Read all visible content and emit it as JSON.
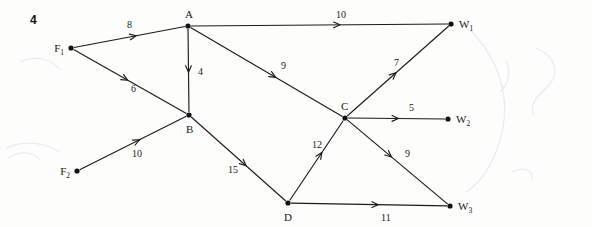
{
  "figure": {
    "number": "4",
    "caption": ""
  },
  "chart_data": {
    "type": "diagram",
    "title": "",
    "subtitle": "",
    "xlabel": "",
    "ylabel": "",
    "diagram_kind": "directed network flow graph",
    "nodes": [
      {
        "id": "F1",
        "label": "F",
        "subscript": "1",
        "x": 71,
        "y": 48,
        "label_x": 52,
        "label_y": 52,
        "label_side": "left"
      },
      {
        "id": "F2",
        "label": "F",
        "subscript": "2",
        "x": 77,
        "y": 171,
        "label_x": 58,
        "label_y": 175,
        "label_side": "left"
      },
      {
        "id": "A",
        "label": "A",
        "subscript": "",
        "x": 188,
        "y": 26,
        "label_x": 185,
        "label_y": 18,
        "label_side": "top"
      },
      {
        "id": "B",
        "label": "B",
        "subscript": "",
        "x": 189,
        "y": 115,
        "label_x": 186,
        "label_y": 133,
        "label_side": "bottom"
      },
      {
        "id": "C",
        "label": "C",
        "subscript": "",
        "x": 345,
        "y": 118,
        "label_x": 341,
        "label_y": 110,
        "label_side": "top"
      },
      {
        "id": "D",
        "label": "D",
        "subscript": "",
        "x": 288,
        "y": 203,
        "label_x": 284,
        "label_y": 221,
        "label_side": "bottom"
      },
      {
        "id": "W1",
        "label": "W",
        "subscript": "1",
        "x": 451,
        "y": 24,
        "label_x": 459,
        "label_y": 28,
        "label_side": "right"
      },
      {
        "id": "W2",
        "label": "W",
        "subscript": "2",
        "x": 448,
        "y": 119,
        "label_x": 456,
        "label_y": 123,
        "label_side": "right"
      },
      {
        "id": "W3",
        "label": "W",
        "subscript": "3",
        "x": 450,
        "y": 206,
        "label_x": 458,
        "label_y": 210,
        "label_side": "right"
      }
    ],
    "edges": [
      {
        "from": "F1",
        "to": "A",
        "weight": "8",
        "label_x": 127,
        "label_y": 28,
        "arrow_t": 0.56
      },
      {
        "from": "F1",
        "to": "B",
        "weight": "6",
        "label_x": 131,
        "label_y": 92,
        "arrow_t": 0.48
      },
      {
        "from": "A",
        "to": "B",
        "weight": "4",
        "label_x": 198,
        "label_y": 75,
        "arrow_t": 0.52
      },
      {
        "from": "A",
        "to": "W1",
        "weight": "10",
        "label_x": 336,
        "label_y": 18,
        "arrow_t": 0.58
      },
      {
        "from": "A",
        "to": "C",
        "weight": "9",
        "label_x": 281,
        "label_y": 69,
        "arrow_t": 0.56
      },
      {
        "from": "F2",
        "to": "B",
        "weight": "10",
        "label_x": 132,
        "label_y": 157,
        "arrow_t": 0.56
      },
      {
        "from": "B",
        "to": "D",
        "weight": "15",
        "label_x": 228,
        "label_y": 173,
        "arrow_t": 0.58
      },
      {
        "from": "D",
        "to": "C",
        "weight": "12",
        "label_x": 312,
        "label_y": 148,
        "arrow_t": 0.6
      },
      {
        "from": "C",
        "to": "W1",
        "weight": "7",
        "label_x": 394,
        "label_y": 66,
        "arrow_t": 0.48
      },
      {
        "from": "C",
        "to": "W2",
        "weight": "5",
        "label_x": 409,
        "label_y": 111,
        "arrow_t": 0.52
      },
      {
        "from": "C",
        "to": "W3",
        "weight": "9",
        "label_x": 405,
        "label_y": 157,
        "arrow_t": 0.44
      },
      {
        "from": "D",
        "to": "W3",
        "weight": "11",
        "label_x": 381,
        "label_y": 221,
        "arrow_t": 0.56
      }
    ]
  }
}
